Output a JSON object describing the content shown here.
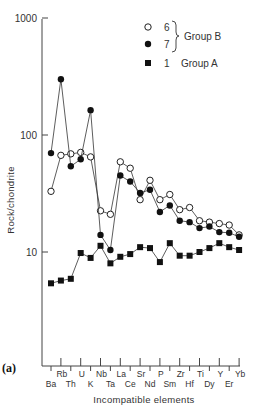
{
  "chart_data": {
    "type": "line",
    "title": "",
    "panel_label": "(a)",
    "xlabel": "Incompatible elements",
    "ylabel": "Rock/chondrite",
    "yscale": "log",
    "ylim": [
      1,
      1000
    ],
    "yticks": [
      {
        "value": 10,
        "label": "10"
      },
      {
        "value": 100,
        "label": "100"
      },
      {
        "value": 1000,
        "label": "1000"
      }
    ],
    "grid": false,
    "categories": [
      "Ba",
      "Rb",
      "Th",
      "U",
      "K",
      "Nb",
      "Ta",
      "La",
      "Ce",
      "Sr",
      "Nd",
      "P",
      "Sm",
      "Zr",
      "Hf",
      "Ti",
      "Dy",
      "Y",
      "Er",
      "Yb"
    ],
    "series": [
      {
        "name": "6",
        "group": "Group B",
        "marker": "open-circle",
        "values": [
          33,
          67,
          69,
          71,
          65,
          22.5,
          21,
          59,
          52,
          28,
          41,
          28,
          31,
          23,
          24,
          18.5,
          18,
          17.5,
          17,
          14
        ]
      },
      {
        "name": "7",
        "group": "Group B",
        "marker": "filled-circle",
        "values": [
          70,
          300,
          54,
          62,
          163,
          14,
          10.4,
          45,
          40,
          32,
          34,
          22,
          25,
          18.5,
          18,
          16,
          16.5,
          14.8,
          14.6,
          13.5
        ]
      },
      {
        "name": "1",
        "group": "Group A",
        "marker": "filled-square",
        "values": [
          5.4,
          5.7,
          5.9,
          9.8,
          8.9,
          11.3,
          8.0,
          9.1,
          9.6,
          11.0,
          10.8,
          8.2,
          11.9,
          9.3,
          9.3,
          10.0,
          10.8,
          11.9,
          11.0,
          10.4
        ]
      }
    ],
    "legend": {
      "position": "upper-right",
      "entries": [
        {
          "marker": "open-circle",
          "label": "6"
        },
        {
          "marker": "filled-circle",
          "label": "7"
        },
        {
          "marker": "filled-square",
          "label": "1"
        }
      ],
      "group_b_label": "Group B",
      "group_a_label": "Group A"
    },
    "annotations": []
  }
}
